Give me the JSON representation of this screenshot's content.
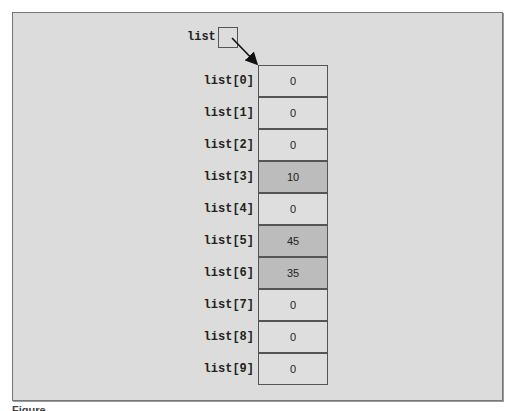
{
  "diagram": {
    "pointer": {
      "label": "list"
    },
    "array": {
      "cells": [
        {
          "index": "list[0]",
          "value": "0",
          "highlighted": false
        },
        {
          "index": "list[1]",
          "value": "0",
          "highlighted": false
        },
        {
          "index": "list[2]",
          "value": "0",
          "highlighted": false
        },
        {
          "index": "list[3]",
          "value": "10",
          "highlighted": true
        },
        {
          "index": "list[4]",
          "value": "0",
          "highlighted": false
        },
        {
          "index": "list[5]",
          "value": "45",
          "highlighted": true
        },
        {
          "index": "list[6]",
          "value": "35",
          "highlighted": true
        },
        {
          "index": "list[7]",
          "value": "0",
          "highlighted": false
        },
        {
          "index": "list[8]",
          "value": "0",
          "highlighted": false
        },
        {
          "index": "list[9]",
          "value": "0",
          "highlighted": false
        }
      ]
    },
    "colors": {
      "background": "#dcdcdc",
      "cell": "#dedede",
      "highlight": "#bcbcbc",
      "border": "#555555"
    }
  },
  "caption": "Figure"
}
